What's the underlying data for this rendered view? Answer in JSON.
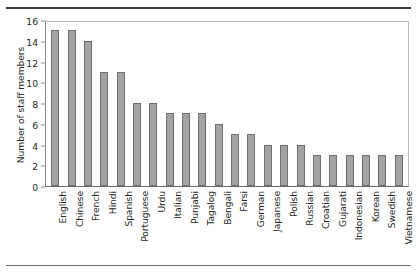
{
  "chart_data": {
    "type": "bar",
    "title": "",
    "xlabel": "",
    "ylabel": "Number of staff members",
    "ylim": [
      0,
      16
    ],
    "yticks": [
      0,
      2,
      4,
      6,
      8,
      10,
      12,
      14,
      16
    ],
    "grid": false,
    "legend": null,
    "bar_color": "#a3a3a3",
    "bar_edge_color": "#6f6f6f",
    "categories": [
      "English",
      "Chinese",
      "French",
      "Hindi",
      "Spanish",
      "Portuguese",
      "Urdu",
      "Italian",
      "Punjabi",
      "Tagalog",
      "Bengali",
      "Farsi",
      "German",
      "Japanese",
      "Polish",
      "Russian",
      "Croatian",
      "Gujarati",
      "Indonesian",
      "Korean",
      "Swedish",
      "Vietnamese"
    ],
    "values": [
      15,
      15,
      14,
      11,
      11,
      8,
      8,
      7,
      7,
      7,
      6,
      5,
      5,
      4,
      4,
      4,
      3,
      3,
      3,
      3,
      3,
      3
    ]
  },
  "figure": {
    "top_rule": "",
    "bottom_rule": ""
  }
}
